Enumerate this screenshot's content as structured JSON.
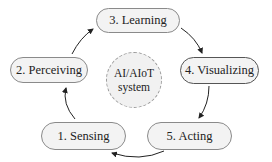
{
  "diagram": {
    "center": {
      "line1": "AI/AIoT",
      "line2": "system"
    },
    "stages": [
      {
        "id": "sensing",
        "label": "1. Sensing"
      },
      {
        "id": "perceiving",
        "label": "2. Perceiving"
      },
      {
        "id": "learning",
        "label": "3. Learning"
      },
      {
        "id": "visualizing",
        "label": "4. Visualizing"
      },
      {
        "id": "acting",
        "label": "5. Acting"
      }
    ],
    "flow": [
      "1. Sensing",
      "2. Perceiving",
      "3. Learning",
      "4. Visualizing",
      "5. Acting",
      "1. Sensing"
    ]
  }
}
